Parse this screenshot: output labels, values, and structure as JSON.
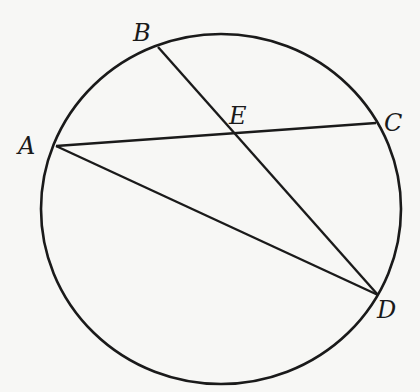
{
  "diagram": {
    "type": "circle-chords",
    "stroke_color": "#1a1a1a",
    "background": "#f7f7f5",
    "circle": {
      "cx": 221,
      "cy": 209,
      "rx": 180,
      "ry": 175
    },
    "points": {
      "A": {
        "label": "A",
        "x": 56,
        "y": 146,
        "lx": 18,
        "ly": 154
      },
      "B": {
        "label": "B",
        "x": 158,
        "y": 47,
        "lx": 133,
        "ly": 41
      },
      "C": {
        "label": "C",
        "x": 376,
        "y": 123,
        "lx": 384,
        "ly": 131
      },
      "D": {
        "label": "D",
        "x": 378,
        "y": 295,
        "lx": 377,
        "ly": 318
      },
      "E": {
        "label": "E",
        "x": 233,
        "y": 134,
        "lx": 229,
        "ly": 124
      }
    },
    "segments": [
      {
        "from": "A",
        "to": "C"
      },
      {
        "from": "A",
        "to": "D"
      },
      {
        "from": "B",
        "to": "D"
      }
    ]
  }
}
